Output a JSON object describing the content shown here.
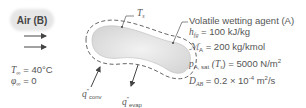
{
  "air": {
    "label": "Air (B)"
  },
  "ambient": {
    "temperature": {
      "symbol": "T",
      "subscript": "∞",
      "value": "= 40°C"
    },
    "humidity": {
      "symbol": "φ",
      "subscript": "∞",
      "value": "= 0"
    }
  },
  "surface": {
    "temperature_label": "T",
    "temperature_sub": "s"
  },
  "fluxes": {
    "conv": {
      "symbol": "q",
      "prime": "″",
      "sub": "conv"
    },
    "evap": {
      "symbol": "q",
      "prime": "″",
      "sub": "evap"
    }
  },
  "properties": {
    "title": "Volatile wetting agent (A)",
    "hfg": {
      "symbol": "h",
      "sub": "fg",
      "value": "= 100 kJ/kg"
    },
    "molar_mass": {
      "symbol": "ℳ",
      "sub": "A",
      "value": "= 200 kg/kmol"
    },
    "psat": {
      "symbol": "p",
      "sub": "A, sat",
      "arg": "(T",
      "arg_sub": "s",
      "arg_close": ")",
      "value": "= 5000 N/m",
      "sup": "2"
    },
    "dab": {
      "symbol": "D",
      "sub": "AB",
      "value": "= 0.2 × 10",
      "exp": "-4",
      "unit": " m",
      "unit_sup": "2",
      "unit_tail": "/s"
    }
  },
  "colors": {
    "body_fill": "#e4e4e4",
    "outline": "#555555",
    "text": "#555555"
  }
}
